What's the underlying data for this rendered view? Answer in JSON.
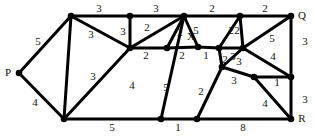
{
  "figure": {
    "kind": "weighted-undirected-graph-diagram",
    "width": 315,
    "height": 136,
    "background_color": "#ffffff",
    "ink_color": "#000000",
    "text_color": "#111111"
  },
  "chart_data": {
    "type": "diagram",
    "title": "",
    "subtitle": "",
    "xlabel": "",
    "ylabel": "",
    "grid": false,
    "legend": null,
    "node_labels": [
      "P",
      "Q",
      "R",
      "X"
    ],
    "nodes": [
      {
        "id": "n0",
        "label": "P",
        "label_pos": "left",
        "x": 19,
        "y": 73
      },
      {
        "id": "n1",
        "label": "",
        "label_pos": "",
        "x": 71,
        "y": 16
      },
      {
        "id": "n2",
        "label": "",
        "label_pos": "",
        "x": 64,
        "y": 119
      },
      {
        "id": "n3",
        "label": "",
        "label_pos": "",
        "x": 130,
        "y": 16
      },
      {
        "id": "n4",
        "label": "",
        "label_pos": "",
        "x": 130,
        "y": 48
      },
      {
        "id": "n5",
        "label": "",
        "label_pos": "",
        "x": 167,
        "y": 48
      },
      {
        "id": "n6",
        "label": "",
        "label_pos": "",
        "x": 184,
        "y": 16
      },
      {
        "id": "n7",
        "label": "X",
        "label_pos": "above",
        "x": 198,
        "y": 47
      },
      {
        "id": "n8",
        "label": "",
        "label_pos": "",
        "x": 161,
        "y": 119
      },
      {
        "id": "n9",
        "label": "",
        "label_pos": "",
        "x": 197,
        "y": 119
      },
      {
        "id": "n10",
        "label": "",
        "label_pos": "",
        "x": 219,
        "y": 48
      },
      {
        "id": "n11",
        "label": "",
        "label_pos": "",
        "x": 222,
        "y": 67
      },
      {
        "id": "n12",
        "label": "",
        "label_pos": "",
        "x": 240,
        "y": 16
      },
      {
        "id": "n13",
        "label": "",
        "label_pos": "",
        "x": 243,
        "y": 48
      },
      {
        "id": "n14",
        "label": "",
        "label_pos": "",
        "x": 254,
        "y": 77
      },
      {
        "id": "n15",
        "label": "Q",
        "label_pos": "right",
        "x": 291,
        "y": 16
      },
      {
        "id": "n16",
        "label": "",
        "label_pos": "",
        "x": 291,
        "y": 77
      },
      {
        "id": "n17",
        "label": "R",
        "label_pos": "right",
        "x": 291,
        "y": 119
      }
    ],
    "edges": [
      {
        "from": "n0",
        "to": "n1",
        "weight": "5",
        "lx": 38,
        "ly": 42
      },
      {
        "from": "n0",
        "to": "n2",
        "weight": "4",
        "lx": 35,
        "ly": 103
      },
      {
        "from": "n1",
        "to": "n3",
        "weight": "3",
        "lx": 99,
        "ly": 9
      },
      {
        "from": "n1",
        "to": "n4",
        "weight": "3",
        "lx": 91,
        "ly": 35
      },
      {
        "from": "n1",
        "to": "n2",
        "weight": "3",
        "lx": 93,
        "ly": 77
      },
      {
        "from": "n3",
        "to": "n6",
        "weight": "3",
        "lx": 156,
        "ly": 9
      },
      {
        "from": "n3",
        "to": "n4",
        "weight": "3",
        "lx": 123,
        "ly": 32
      },
      {
        "from": "n4",
        "to": "n6",
        "weight": "2",
        "lx": 147,
        "ly": 28
      },
      {
        "from": "n4",
        "to": "n5",
        "weight": "2",
        "lx": 146,
        "ly": 56
      },
      {
        "from": "n4",
        "to": "n2",
        "weight": "4",
        "lx": 132,
        "ly": 86
      },
      {
        "from": "n5",
        "to": "n6",
        "weight": "2",
        "lx": 180,
        "ly": 33
      },
      {
        "from": "n5",
        "to": "n7",
        "weight": "2",
        "lx": 182,
        "ly": 56
      },
      {
        "from": "n6",
        "to": "n7",
        "weight": "5",
        "lx": 196,
        "ly": 31
      },
      {
        "from": "n6",
        "to": "n8",
        "weight": "5",
        "lx": 166,
        "ly": 88
      },
      {
        "from": "n6",
        "to": "n12",
        "weight": "2",
        "lx": 212,
        "ly": 9
      },
      {
        "from": "n7",
        "to": "n10",
        "weight": "1",
        "lx": 206,
        "ly": 56
      },
      {
        "from": "n2",
        "to": "n8",
        "weight": "5",
        "lx": 112,
        "ly": 128
      },
      {
        "from": "n8",
        "to": "n9",
        "weight": "1",
        "lx": 178,
        "ly": 128
      },
      {
        "from": "n9",
        "to": "n11",
        "weight": "2",
        "lx": 201,
        "ly": 92
      },
      {
        "from": "n9",
        "to": "n17",
        "weight": "8",
        "lx": 243,
        "ly": 128
      },
      {
        "from": "n10",
        "to": "n11",
        "weight": "2",
        "lx": 225,
        "ly": 60
      },
      {
        "from": "n10",
        "to": "n12",
        "weight": "2",
        "lx": 231,
        "ly": 31
      },
      {
        "from": "n10",
        "to": "n13",
        "weight": "3",
        "lx": 233,
        "ly": 57
      },
      {
        "from": "n11",
        "to": "n13",
        "weight": "3",
        "lx": 239,
        "ly": 62
      },
      {
        "from": "n11",
        "to": "n14",
        "weight": "3",
        "lx": 234,
        "ly": 81
      },
      {
        "from": "n12",
        "to": "n13",
        "weight": "2",
        "lx": 237,
        "ly": 31
      },
      {
        "from": "n12",
        "to": "n15",
        "weight": "2",
        "lx": 265,
        "ly": 9
      },
      {
        "from": "n13",
        "to": "n15",
        "weight": "5",
        "lx": 272,
        "ly": 39
      },
      {
        "from": "n13",
        "to": "n16",
        "weight": "4",
        "lx": 273,
        "ly": 57
      },
      {
        "from": "n14",
        "to": "n16",
        "weight": "1",
        "lx": 277,
        "ly": 83
      },
      {
        "from": "n14",
        "to": "n17",
        "weight": "4",
        "lx": 265,
        "ly": 104
      },
      {
        "from": "n15",
        "to": "n16",
        "weight": "3",
        "lx": 305,
        "ly": 42
      },
      {
        "from": "n16",
        "to": "n17",
        "weight": "3",
        "lx": 305,
        "ly": 100
      }
    ]
  }
}
